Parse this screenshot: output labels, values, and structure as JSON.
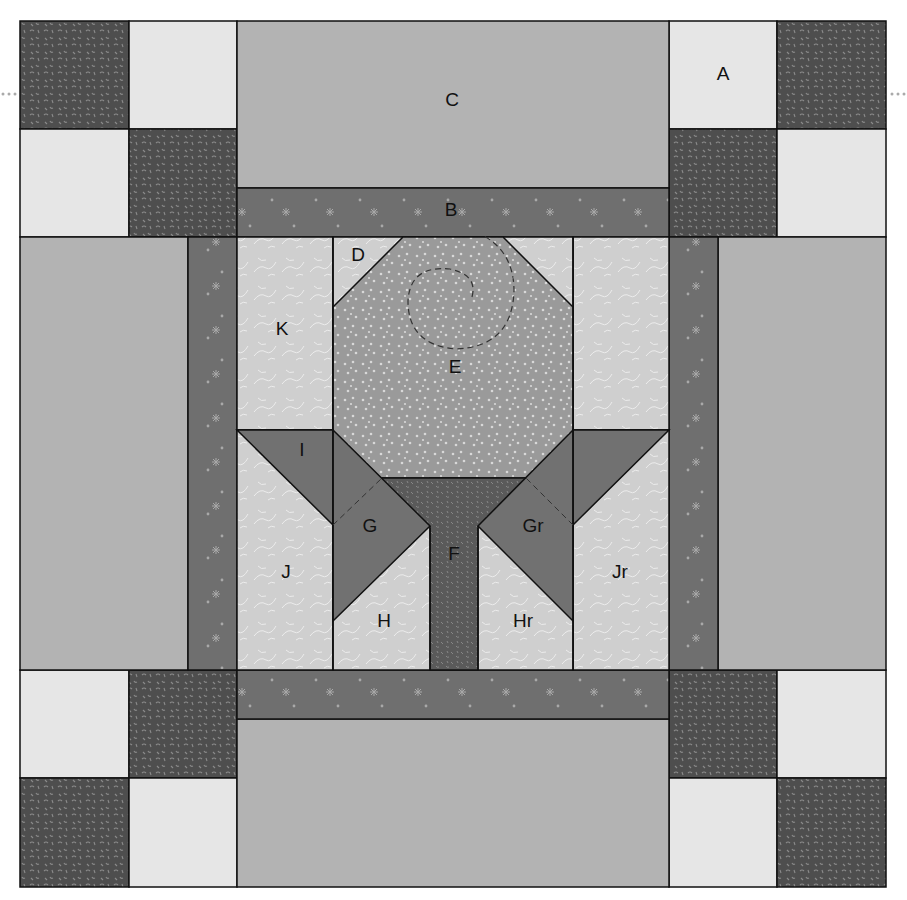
{
  "diagram": {
    "colors": {
      "dark_print": "#4e4e4e",
      "light_square": "#e6e6e6",
      "medium_panel": "#b3b3b3",
      "star_strip": "#6f6f6f",
      "vine_background": "#cfcfcf",
      "dot_flower": "#9a9a9a",
      "leaf_dark": "#717171",
      "stem": "#5a5a5a",
      "outline": "#111111"
    },
    "labels": {
      "A": "A",
      "B": "B",
      "C": "C",
      "D": "D",
      "E": "E",
      "F": "F",
      "G": "G",
      "Gr": "Gr",
      "H": "H",
      "Hr": "Hr",
      "I": "I",
      "J": "J",
      "Jr": "Jr",
      "K": "K"
    },
    "pieces": [
      {
        "id": "A",
        "description": "nine-patch corner squares (light/dark print)"
      },
      {
        "id": "B",
        "description": "star-print sashing strips"
      },
      {
        "id": "C",
        "description": "medium solid rectangles"
      },
      {
        "id": "D",
        "description": "vine-print corner triangles"
      },
      {
        "id": "E",
        "description": "dotted flower head octagon with spiral quilting"
      },
      {
        "id": "F",
        "description": "dark print stem"
      },
      {
        "id": "G",
        "description": "left leaf"
      },
      {
        "id": "Gr",
        "description": "right leaf (reversed)"
      },
      {
        "id": "H",
        "description": "left background triangle under leaf"
      },
      {
        "id": "Hr",
        "description": "right background triangle under leaf (reversed)"
      },
      {
        "id": "I",
        "description": "leaf tip triangle"
      },
      {
        "id": "J",
        "description": "left background piece"
      },
      {
        "id": "Jr",
        "description": "right background piece (reversed)"
      },
      {
        "id": "K",
        "description": "background side rectangle"
      }
    ]
  }
}
